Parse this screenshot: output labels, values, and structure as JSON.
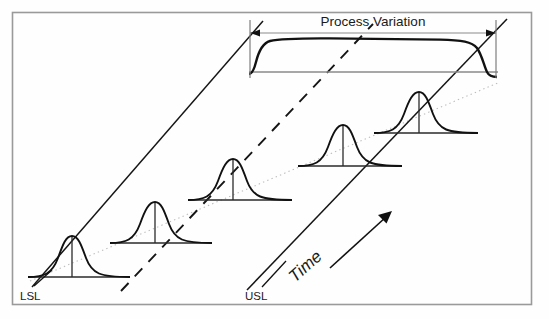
{
  "figure": {
    "title_annotation": "Process Variation",
    "time_axis_label": "Time",
    "lower_spec_label": "LSL",
    "upper_spec_label": "USL",
    "colors": {
      "ink": "#111111",
      "frame": "#9a9a9a",
      "thin_rule": "#8a8a8a",
      "dotted_trend": "#b4b4b4",
      "background": "#fefefe"
    },
    "frame": {
      "x": 12,
      "y": 12,
      "width": 520,
      "height": 293
    },
    "process_variation_span": {
      "arrow_y": 33,
      "x_start": 250,
      "x_end": 496,
      "tick_bottom_y": 76
    },
    "plateau_curve": {
      "baseline_y": 72,
      "x_start": 248,
      "x_end": 498,
      "top_y": 40,
      "description": "wide flattened distribution representing total process variation"
    },
    "distributions": [
      {
        "index": 1,
        "baseline_y": 277,
        "x_start": 28,
        "x_end": 130,
        "peak_x": 72,
        "peak_y": 236
      },
      {
        "index": 2,
        "baseline_y": 243,
        "x_start": 110,
        "x_end": 212,
        "peak_x": 155,
        "peak_y": 202
      },
      {
        "index": 3,
        "baseline_y": 200,
        "x_start": 188,
        "x_end": 292,
        "peak_x": 233,
        "peak_y": 159
      },
      {
        "index": 4,
        "baseline_y": 166,
        "x_start": 298,
        "x_end": 402,
        "peak_x": 343,
        "peak_y": 125
      },
      {
        "index": 5,
        "baseline_y": 133,
        "x_start": 374,
        "x_end": 478,
        "peak_x": 419,
        "peak_y": 92
      }
    ],
    "spec_limit_lines": [
      {
        "name": "lower-spec-diagonal",
        "x1": 32,
        "y1": 286,
        "x2": 262,
        "y2": 22,
        "style": "solid"
      },
      {
        "name": "center-diagonal",
        "x1": 122,
        "y1": 290,
        "x2": 372,
        "y2": 25,
        "style": "dashed"
      },
      {
        "name": "upper-spec-diagonal",
        "x1": 248,
        "y1": 289,
        "x2": 506,
        "y2": 20,
        "style": "solid"
      }
    ],
    "trend_line": {
      "name": "mean-shift-dotted-trend",
      "x1": 30,
      "y1": 281,
      "x2": 500,
      "y2": 82,
      "style": "dotted"
    },
    "time_arrow": {
      "x1": 330,
      "y1": 268,
      "x2": 392,
      "y2": 212
    },
    "leaders": {
      "lsl": {
        "x1": 33,
        "y1": 285,
        "x2": 50,
        "y2": 271
      },
      "usl": {
        "x1": 262,
        "y1": 285,
        "x2": 283,
        "y2": 262
      }
    }
  }
}
